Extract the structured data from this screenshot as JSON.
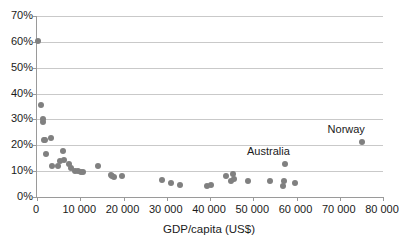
{
  "chart_data": {
    "type": "scatter",
    "title": "",
    "xlabel": "GDP/capita (US$)",
    "ylabel": "",
    "xlim": [
      0,
      80000
    ],
    "ylim": [
      0,
      0.7
    ],
    "grid": true,
    "legend": "none",
    "y_tick_labels": [
      "0%",
      "10%",
      "20%",
      "30%",
      "40%",
      "50%",
      "60%",
      "70%"
    ],
    "y_tick_values": [
      0,
      0.1,
      0.2,
      0.3,
      0.4,
      0.5,
      0.6,
      0.7
    ],
    "x_tick_labels": [
      "0",
      "10 000",
      "20 000",
      "30 000",
      "40 000",
      "50 000",
      "60 000",
      "70 000",
      "80 000"
    ],
    "x_tick_values": [
      0,
      10000,
      20000,
      30000,
      40000,
      50000,
      60000,
      70000,
      80000
    ],
    "point_color": "#808080",
    "points": [
      {
        "x": 300,
        "y": 0.605
      },
      {
        "x": 900,
        "y": 0.357
      },
      {
        "x": 1500,
        "y": 0.303
      },
      {
        "x": 1400,
        "y": 0.289
      },
      {
        "x": 1600,
        "y": 0.222
      },
      {
        "x": 1800,
        "y": 0.22
      },
      {
        "x": 3300,
        "y": 0.228
      },
      {
        "x": 2100,
        "y": 0.167
      },
      {
        "x": 3500,
        "y": 0.12
      },
      {
        "x": 5900,
        "y": 0.176
      },
      {
        "x": 5400,
        "y": 0.139
      },
      {
        "x": 6200,
        "y": 0.143
      },
      {
        "x": 4900,
        "y": 0.12
      },
      {
        "x": 7400,
        "y": 0.126
      },
      {
        "x": 7900,
        "y": 0.113
      },
      {
        "x": 8900,
        "y": 0.1
      },
      {
        "x": 9400,
        "y": 0.099
      },
      {
        "x": 10100,
        "y": 0.098
      },
      {
        "x": 10700,
        "y": 0.098
      },
      {
        "x": 14100,
        "y": 0.12
      },
      {
        "x": 17000,
        "y": 0.085
      },
      {
        "x": 17400,
        "y": 0.082
      },
      {
        "x": 17900,
        "y": 0.077
      },
      {
        "x": 19600,
        "y": 0.08
      },
      {
        "x": 28900,
        "y": 0.066
      },
      {
        "x": 30900,
        "y": 0.054
      },
      {
        "x": 33100,
        "y": 0.048
      },
      {
        "x": 39400,
        "y": 0.044
      },
      {
        "x": 40300,
        "y": 0.046
      },
      {
        "x": 43800,
        "y": 0.083
      },
      {
        "x": 45400,
        "y": 0.09
      },
      {
        "x": 44900,
        "y": 0.062
      },
      {
        "x": 45500,
        "y": 0.071
      },
      {
        "x": 48800,
        "y": 0.062
      },
      {
        "x": 53900,
        "y": 0.061
      },
      {
        "x": 57100,
        "y": 0.062
      },
      {
        "x": 56800,
        "y": 0.042
      },
      {
        "x": 59700,
        "y": 0.056
      },
      {
        "x": 57400,
        "y": 0.128
      },
      {
        "x": 75200,
        "y": 0.213
      }
    ],
    "annotations": [
      {
        "text": "Norway",
        "x": 71500,
        "y": 0.262
      },
      {
        "text": "Australia",
        "x": 53500,
        "y": 0.178
      }
    ]
  }
}
